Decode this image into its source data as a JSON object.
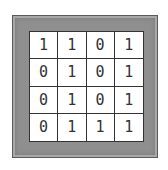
{
  "board": {
    "rows": [
      [
        "1",
        "1",
        "0",
        "1"
      ],
      [
        "0",
        "1",
        "0",
        "1"
      ],
      [
        "0",
        "1",
        "0",
        "1"
      ],
      [
        "0",
        "1",
        "1",
        "1"
      ]
    ],
    "frame_color": "#8f8f8f"
  }
}
